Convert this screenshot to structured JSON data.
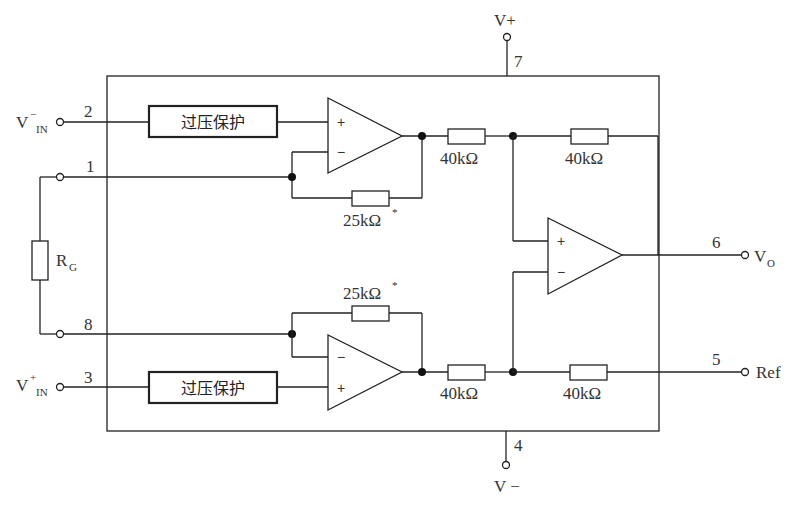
{
  "diagram": {
    "type": "instrumentation-amplifier-schematic",
    "pins": {
      "p2": {
        "number": "2",
        "label_main": "V",
        "label_sup": "−",
        "label_sub": "IN"
      },
      "p1": {
        "number": "1"
      },
      "p8": {
        "number": "8"
      },
      "p3": {
        "number": "3",
        "label_main": "V",
        "label_sup": "+",
        "label_sub": "IN"
      },
      "p7": {
        "number": "7",
        "label": "V+"
      },
      "p4": {
        "number": "4",
        "label": "V −"
      },
      "p6": {
        "number": "6",
        "label_main": "V",
        "label_sub": "O"
      },
      "p5": {
        "number": "5",
        "label": "Ref"
      }
    },
    "external": {
      "rg": {
        "label_main": "R",
        "label_sub": "G"
      }
    },
    "blocks": {
      "ovp_top": {
        "label": "过压保护"
      },
      "ovp_bottom": {
        "label": "过压保护"
      }
    },
    "resistors": {
      "r_fb_top": {
        "value": "25kΩ",
        "mark": "*"
      },
      "r_fb_bottom": {
        "value": "25kΩ",
        "mark": "*"
      },
      "r_in_top": {
        "value": "40kΩ"
      },
      "r_in_bottom": {
        "value": "40kΩ"
      },
      "r_fb_out": {
        "value": "40kΩ"
      },
      "r_ref": {
        "value": "40kΩ"
      }
    },
    "opamps": {
      "a1": {
        "plus": "+",
        "minus": "−"
      },
      "a2": {
        "plus": "+",
        "minus": "−"
      },
      "a3": {
        "plus": "+",
        "minus": "−"
      }
    }
  }
}
